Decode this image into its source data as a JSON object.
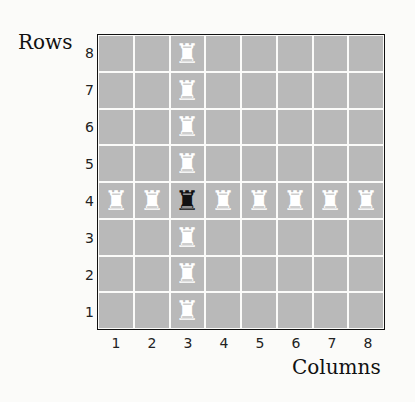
{
  "labels": {
    "rows": "Rows",
    "columns": "Columns"
  },
  "row_numbers": [
    "8",
    "7",
    "6",
    "5",
    "4",
    "3",
    "2",
    "1"
  ],
  "col_numbers": [
    "1",
    "2",
    "3",
    "4",
    "5",
    "6",
    "7",
    "8"
  ],
  "pieces": {
    "black_rook": {
      "row": 4,
      "col": 3,
      "glyph": "♜"
    },
    "white_rook_glyph": "♜",
    "white_rooks": [
      [
        8,
        3
      ],
      [
        7,
        3
      ],
      [
        6,
        3
      ],
      [
        5,
        3
      ],
      [
        3,
        3
      ],
      [
        2,
        3
      ],
      [
        1,
        3
      ],
      [
        4,
        1
      ],
      [
        4,
        2
      ],
      [
        4,
        4
      ],
      [
        4,
        5
      ],
      [
        4,
        6
      ],
      [
        4,
        7
      ],
      [
        4,
        8
      ]
    ]
  },
  "colors": {
    "square": "#b9b9b9",
    "grid": "#fbfbf9",
    "black_piece": "#111111",
    "white_piece": "#ffffff"
  }
}
